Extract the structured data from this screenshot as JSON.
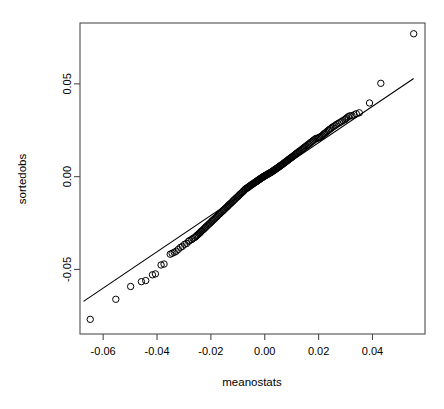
{
  "chart_data": {
    "type": "scatter",
    "title": "",
    "subtitle": "",
    "xlabel": "meanostats",
    "ylabel": "sortedobs",
    "xlim": [
      -0.0686,
      0.0595
    ],
    "ylim": [
      -0.0848,
      0.0828
    ],
    "grid": false,
    "legend": null,
    "x_ticks": [
      -0.06,
      -0.04,
      -0.02,
      0.0,
      0.02,
      0.04
    ],
    "x_tick_labels": [
      "-0.06",
      "-0.04",
      "-0.02",
      "0.00",
      "0.02",
      "0.04"
    ],
    "y_ticks": [
      -0.05,
      0.0,
      0.05
    ],
    "y_tick_labels": [
      "-0.05",
      "0.00",
      "0.05"
    ],
    "annotations": [
      "QQ plot of sorted observations against mean order statistics",
      "Reference line drawn through quartiles",
      "Points in lower tail fall below the line; points in upper tail rise above the line"
    ],
    "reference_line": {
      "name": "qq-reference-line",
      "x0": -0.0673,
      "y0": -0.0672,
      "x1": 0.0553,
      "y1": 0.0529
    },
    "marker": {
      "shape": "open-circle",
      "radius_px": 3.2,
      "stroke": "#000000",
      "fill": "none"
    },
    "n_points": 221,
    "series": [
      {
        "name": "sortedobs vs meanostats",
        "points": [
          [
            -0.0648,
            -0.0769
          ],
          [
            -0.0553,
            -0.0661
          ],
          [
            -0.0498,
            -0.0592
          ],
          [
            -0.0458,
            -0.0566
          ],
          [
            -0.0442,
            -0.056
          ],
          [
            -0.0417,
            -0.0529
          ],
          [
            -0.0406,
            -0.0524
          ],
          [
            -0.0385,
            -0.0476
          ],
          [
            -0.0374,
            -0.0471
          ],
          [
            -0.0351,
            -0.0418
          ],
          [
            -0.0344,
            -0.0413
          ],
          [
            -0.0336,
            -0.0408
          ],
          [
            -0.0329,
            -0.0402
          ],
          [
            -0.0321,
            -0.0392
          ],
          [
            -0.0313,
            -0.0381
          ],
          [
            -0.0306,
            -0.0376
          ],
          [
            -0.0298,
            -0.0365
          ],
          [
            -0.029,
            -0.036
          ],
          [
            -0.0283,
            -0.0349
          ],
          [
            -0.0279,
            -0.0344
          ],
          [
            -0.0271,
            -0.0339
          ],
          [
            -0.0267,
            -0.0333
          ],
          [
            -0.026,
            -0.0328
          ],
          [
            -0.0256,
            -0.0323
          ],
          [
            -0.0252,
            -0.0317
          ],
          [
            -0.0248,
            -0.0312
          ],
          [
            -0.0244,
            -0.0307
          ],
          [
            -0.024,
            -0.0302
          ],
          [
            -0.0237,
            -0.0296
          ],
          [
            -0.0233,
            -0.0291
          ],
          [
            -0.0229,
            -0.0286
          ],
          [
            -0.0225,
            -0.0281
          ],
          [
            -0.0221,
            -0.0275
          ],
          [
            -0.0218,
            -0.027
          ],
          [
            -0.0214,
            -0.0265
          ],
          [
            -0.021,
            -0.0259
          ],
          [
            -0.0206,
            -0.0254
          ],
          [
            -0.0202,
            -0.0249
          ],
          [
            -0.0198,
            -0.0243
          ],
          [
            -0.0195,
            -0.0238
          ],
          [
            -0.0191,
            -0.0233
          ],
          [
            -0.0187,
            -0.0228
          ],
          [
            -0.0183,
            -0.0222
          ],
          [
            -0.0179,
            -0.0217
          ],
          [
            -0.0176,
            -0.0212
          ],
          [
            -0.0172,
            -0.0206
          ],
          [
            -0.0168,
            -0.0201
          ],
          [
            -0.0164,
            -0.0196
          ],
          [
            -0.016,
            -0.019
          ],
          [
            -0.0156,
            -0.0185
          ],
          [
            -0.0153,
            -0.018
          ],
          [
            -0.0149,
            -0.0175
          ],
          [
            -0.0145,
            -0.0169
          ],
          [
            -0.0141,
            -0.0164
          ],
          [
            -0.0137,
            -0.0159
          ],
          [
            -0.0134,
            -0.0153
          ],
          [
            -0.013,
            -0.0148
          ],
          [
            -0.0126,
            -0.0143
          ],
          [
            -0.0122,
            -0.0138
          ],
          [
            -0.0118,
            -0.0132
          ],
          [
            -0.0115,
            -0.0127
          ],
          [
            -0.0111,
            -0.0122
          ],
          [
            -0.0107,
            -0.0116
          ],
          [
            -0.0103,
            -0.0111
          ],
          [
            -0.0099,
            -0.0106
          ],
          [
            -0.0096,
            -0.0101
          ],
          [
            -0.0092,
            -0.0095
          ],
          [
            -0.0088,
            -0.009
          ],
          [
            -0.0084,
            -0.0085
          ],
          [
            -0.008,
            -0.0079
          ],
          [
            -0.0077,
            -0.0074
          ],
          [
            -0.0073,
            -0.0069
          ],
          [
            -0.0071,
            -0.0066
          ],
          [
            -0.0068,
            -0.0063
          ],
          [
            -0.0065,
            -0.0061
          ],
          [
            -0.0063,
            -0.0058
          ],
          [
            -0.006,
            -0.0056
          ],
          [
            -0.0058,
            -0.0053
          ],
          [
            -0.0055,
            -0.005
          ],
          [
            -0.0053,
            -0.0048
          ],
          [
            -0.005,
            -0.0045
          ],
          [
            -0.0048,
            -0.0043
          ],
          [
            -0.0045,
            -0.004
          ],
          [
            -0.0043,
            -0.0038
          ],
          [
            -0.004,
            -0.0035
          ],
          [
            -0.0038,
            -0.0033
          ],
          [
            -0.0035,
            -0.003
          ],
          [
            -0.0033,
            -0.0028
          ],
          [
            -0.0031,
            -0.0026
          ],
          [
            -0.0029,
            -0.0024
          ],
          [
            -0.0027,
            -0.0022
          ],
          [
            -0.0025,
            -0.002
          ],
          [
            -0.0023,
            -0.0018
          ],
          [
            -0.0021,
            -0.0016
          ],
          [
            -0.0019,
            -0.0014
          ],
          [
            -0.0017,
            -0.0012
          ],
          [
            -0.0015,
            -0.001
          ],
          [
            -0.0013,
            -0.0008
          ],
          [
            -0.0011,
            -0.0006
          ],
          [
            -0.0009,
            -0.0004
          ],
          [
            -0.0008,
            -0.0003
          ],
          [
            -0.0006,
            -0.0001
          ],
          [
            -0.0004,
            0.0001
          ],
          [
            -0.0002,
            0.0002
          ],
          [
            0.0,
            0.0004
          ],
          [
            0.0002,
            0.0006
          ],
          [
            0.0004,
            0.0007
          ],
          [
            0.0006,
            0.0009
          ],
          [
            0.0008,
            0.0011
          ],
          [
            0.001,
            0.0012
          ],
          [
            0.0012,
            0.0014
          ],
          [
            0.0014,
            0.0016
          ],
          [
            0.0016,
            0.0017
          ],
          [
            0.0018,
            0.0019
          ],
          [
            0.002,
            0.0021
          ],
          [
            0.0022,
            0.0022
          ],
          [
            0.0024,
            0.0024
          ],
          [
            0.0026,
            0.0026
          ],
          [
            0.0028,
            0.0028
          ],
          [
            0.003,
            0.003
          ],
          [
            0.0032,
            0.0032
          ],
          [
            0.0034,
            0.0034
          ],
          [
            0.0036,
            0.0036
          ],
          [
            0.0038,
            0.0038
          ],
          [
            0.004,
            0.004
          ],
          [
            0.0042,
            0.0042
          ],
          [
            0.0044,
            0.0044
          ],
          [
            0.0046,
            0.0046
          ],
          [
            0.0049,
            0.0049
          ],
          [
            0.0051,
            0.0051
          ],
          [
            0.0053,
            0.0053
          ],
          [
            0.0055,
            0.0056
          ],
          [
            0.0058,
            0.0058
          ],
          [
            0.006,
            0.0061
          ],
          [
            0.0062,
            0.0063
          ],
          [
            0.0065,
            0.0066
          ],
          [
            0.0067,
            0.0068
          ],
          [
            0.007,
            0.0071
          ],
          [
            0.0072,
            0.0074
          ],
          [
            0.0075,
            0.0077
          ],
          [
            0.0077,
            0.0079
          ],
          [
            0.008,
            0.0082
          ],
          [
            0.0082,
            0.0085
          ],
          [
            0.0085,
            0.0088
          ],
          [
            0.0088,
            0.0091
          ],
          [
            0.009,
            0.0094
          ],
          [
            0.0093,
            0.0097
          ],
          [
            0.0096,
            0.01
          ],
          [
            0.0099,
            0.0103
          ],
          [
            0.0102,
            0.0107
          ],
          [
            0.0105,
            0.011
          ],
          [
            0.0108,
            0.0113
          ],
          [
            0.0111,
            0.0117
          ],
          [
            0.0114,
            0.012
          ],
          [
            0.0117,
            0.0124
          ],
          [
            0.012,
            0.0127
          ],
          [
            0.0123,
            0.0131
          ],
          [
            0.0127,
            0.0135
          ],
          [
            0.013,
            0.0138
          ],
          [
            0.0134,
            0.0142
          ],
          [
            0.0137,
            0.0146
          ],
          [
            0.0141,
            0.015
          ],
          [
            0.0144,
            0.0154
          ],
          [
            0.0148,
            0.0159
          ],
          [
            0.0152,
            0.0163
          ],
          [
            0.0156,
            0.0167
          ],
          [
            0.016,
            0.0172
          ],
          [
            0.0164,
            0.0176
          ],
          [
            0.0168,
            0.0181
          ],
          [
            0.0172,
            0.0186
          ],
          [
            0.0177,
            0.0191
          ],
          [
            0.0181,
            0.0196
          ],
          [
            0.0186,
            0.0201
          ],
          [
            0.019,
            0.0206
          ],
          [
            0.0195,
            0.0206
          ],
          [
            0.0199,
            0.0209
          ],
          [
            0.0203,
            0.0212
          ],
          [
            0.0206,
            0.0214
          ],
          [
            0.021,
            0.0217
          ],
          [
            0.0214,
            0.0222
          ],
          [
            0.0218,
            0.0228
          ],
          [
            0.0222,
            0.0233
          ],
          [
            0.0227,
            0.0238
          ],
          [
            0.0231,
            0.0243
          ],
          [
            0.0236,
            0.0249
          ],
          [
            0.024,
            0.0254
          ],
          [
            0.0245,
            0.0259
          ],
          [
            0.025,
            0.0265
          ],
          [
            0.0255,
            0.027
          ],
          [
            0.0261,
            0.0275
          ],
          [
            0.0266,
            0.0281
          ],
          [
            0.0272,
            0.0286
          ],
          [
            0.0278,
            0.0291
          ],
          [
            0.0284,
            0.0296
          ],
          [
            0.029,
            0.0302
          ],
          [
            0.0297,
            0.0307
          ],
          [
            0.0301,
            0.0312
          ],
          [
            0.0305,
            0.0317
          ],
          [
            0.031,
            0.0323
          ],
          [
            0.0316,
            0.0328
          ],
          [
            0.0324,
            0.0328
          ],
          [
            0.0332,
            0.0333
          ],
          [
            0.034,
            0.0339
          ],
          [
            0.0351,
            0.0344
          ],
          [
            0.0389,
            0.0397
          ],
          [
            0.0431,
            0.0503
          ],
          [
            0.0553,
            0.077
          ]
        ]
      }
    ]
  },
  "plot": {
    "box": {
      "left": 80,
      "top": 23,
      "right": 425,
      "bottom": 334
    },
    "axes": {
      "x_label_text": "meanostats",
      "y_label_text": "sortedobs"
    }
  }
}
